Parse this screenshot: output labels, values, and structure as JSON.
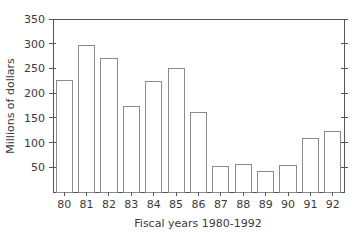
{
  "chart_data": {
    "type": "bar",
    "title": "",
    "subtitle": "",
    "xlabel": "Fiscal years 1980-1992",
    "ylabel": "Millions of dollars",
    "categories": [
      "80",
      "81",
      "82",
      "83",
      "84",
      "85",
      "86",
      "87",
      "88",
      "89",
      "90",
      "91",
      "92"
    ],
    "values": [
      225,
      296,
      270,
      172,
      224,
      249,
      161,
      51,
      55,
      41,
      54,
      109,
      122
    ],
    "ylim": [
      0,
      350
    ],
    "yticks": [
      50,
      100,
      150,
      200,
      250,
      300,
      350
    ],
    "ytick_labels": [
      "50",
      "100",
      "150",
      "200",
      "250",
      "300",
      "350"
    ],
    "xtick_labels": [
      "80",
      "81",
      "82",
      "83",
      "84",
      "85",
      "86",
      "87",
      "88",
      "89",
      "90",
      "91",
      "92"
    ],
    "grid": false,
    "legend": null,
    "legend_position": "none",
    "bar_fill_color": "#ffffff",
    "bar_edge_color": "#8a8a8a",
    "axis_color": "#555555",
    "text_color": "#3a3a3a",
    "background_color": "#ffffff",
    "annotations": []
  },
  "plot_geometry": {
    "left": 53,
    "right": 344,
    "top": 19,
    "bottom": 192,
    "bar_width_ratio": 0.72
  }
}
